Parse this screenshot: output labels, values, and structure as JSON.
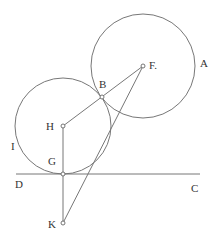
{
  "diagram": {
    "type": "geometric construction",
    "colors": {
      "stroke": "#777777",
      "text": "#333333",
      "background": "#ffffff"
    },
    "circles": [
      {
        "name": "circle-A",
        "center": "F",
        "cx": 143,
        "cy": 66,
        "r": 52
      },
      {
        "name": "circle-I",
        "center": "H",
        "cx": 63,
        "cy": 126,
        "r": 48
      }
    ],
    "points": [
      {
        "id": "F",
        "x": 143,
        "y": 66
      },
      {
        "id": "B",
        "x": 102,
        "y": 97
      },
      {
        "id": "H",
        "x": 63,
        "y": 126
      },
      {
        "id": "G",
        "x": 63,
        "y": 174
      },
      {
        "id": "K",
        "x": 63,
        "y": 223
      }
    ],
    "segments": [
      [
        "H",
        "B"
      ],
      [
        "B",
        "F"
      ],
      [
        "F",
        "K"
      ],
      [
        "H",
        "K"
      ]
    ],
    "line_DC": {
      "x1": 16,
      "y1": 174,
      "x2": 200,
      "y2": 174
    },
    "labels": {
      "A": "A",
      "B": "B",
      "C": "C",
      "D": "D",
      "F": "F.",
      "G": "G",
      "H": "H",
      "I": "I",
      "K": "K"
    }
  }
}
